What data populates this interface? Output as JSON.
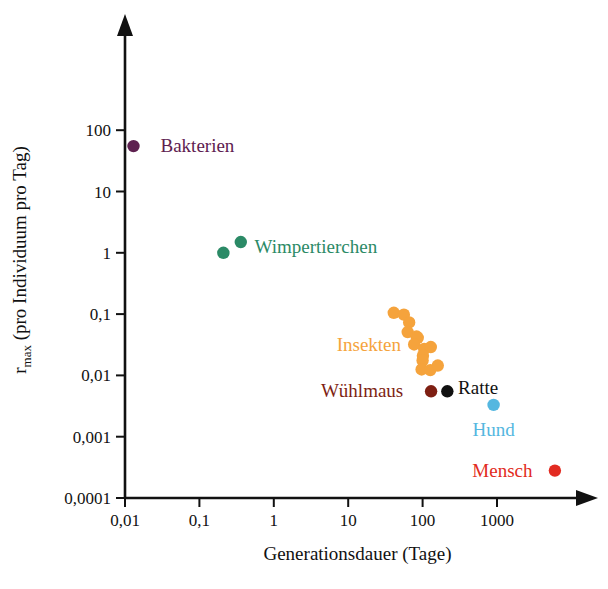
{
  "chart_data": {
    "type": "scatter",
    "title": "",
    "xlabel": "Generationsdauer (Tage)",
    "ylabel_main": "r",
    "ylabel_sub": "max",
    "ylabel_rest": " (pro Individuum pro Tag)",
    "ylabel_full": "rmax (pro Individuum pro Tag)",
    "xscale": "log",
    "yscale": "log",
    "xlim": [
      0.01,
      10000
    ],
    "ylim": [
      0.0001,
      200
    ],
    "grid": false,
    "legend": "inline-labels",
    "xticks": [
      "0,01",
      "0,1",
      "1",
      "10",
      "100",
      "1000"
    ],
    "xtick_values": [
      0.01,
      0.1,
      1,
      10,
      100,
      1000
    ],
    "yticks": [
      "0,0001",
      "0,001",
      "0,01",
      "0,1",
      "1",
      "10",
      "100"
    ],
    "ytick_values": [
      0.0001,
      0.001,
      0.01,
      0.1,
      1,
      10,
      100
    ],
    "series": [
      {
        "name": "Bakterien",
        "color": "#5e2150",
        "label_color": "#5e2150",
        "label_anchor": "start",
        "label_x": 0.03,
        "label_y": 55,
        "points": [
          {
            "x": 0.013,
            "y": 55
          }
        ]
      },
      {
        "name": "Wimpertierchen",
        "color": "#2b8a66",
        "label_color": "#2b8a66",
        "label_anchor": "start",
        "label_x": 0.55,
        "label_y": 1.25,
        "points": [
          {
            "x": 0.21,
            "y": 1.0
          },
          {
            "x": 0.36,
            "y": 1.5
          }
        ]
      },
      {
        "name": "Insekten",
        "color": "#f5a33c",
        "label_color": "#f5a33c",
        "label_anchor": "start",
        "label_x": 7.0,
        "label_y": 0.031,
        "points": [
          {
            "x": 41,
            "y": 0.105
          },
          {
            "x": 56,
            "y": 0.098
          },
          {
            "x": 66,
            "y": 0.073
          },
          {
            "x": 63,
            "y": 0.051
          },
          {
            "x": 83,
            "y": 0.043
          },
          {
            "x": 86,
            "y": 0.041
          },
          {
            "x": 77,
            "y": 0.032
          },
          {
            "x": 105,
            "y": 0.027
          },
          {
            "x": 129,
            "y": 0.029
          },
          {
            "x": 101,
            "y": 0.021
          },
          {
            "x": 100,
            "y": 0.0175
          },
          {
            "x": 97,
            "y": 0.0125
          },
          {
            "x": 127,
            "y": 0.0122
          },
          {
            "x": 160,
            "y": 0.0145
          }
        ]
      },
      {
        "name": "Wühlmaus",
        "color": "#7e1f13",
        "label_color": "#7e1f13",
        "label_anchor": "end",
        "label_x": 55,
        "label_y": 0.0055,
        "points": [
          {
            "x": 130,
            "y": 0.0055
          }
        ]
      },
      {
        "name": "Ratte",
        "color": "#111111",
        "label_color": "#111111",
        "label_anchor": "start",
        "label_x": 300,
        "label_y": 0.0062,
        "points": [
          {
            "x": 215,
            "y": 0.0055
          }
        ]
      },
      {
        "name": "Hund",
        "color": "#54b7e0",
        "label_color": "#54b7e0",
        "label_anchor": "middle",
        "label_x": 900,
        "label_y": 0.0013,
        "points": [
          {
            "x": 900,
            "y": 0.0033
          }
        ]
      },
      {
        "name": "Mensch",
        "color": "#e22b21",
        "label_color": "#e22b21",
        "label_anchor": "end",
        "label_x": 3000,
        "label_y": 0.00028,
        "points": [
          {
            "x": 6000,
            "y": 0.00028
          }
        ]
      }
    ]
  }
}
